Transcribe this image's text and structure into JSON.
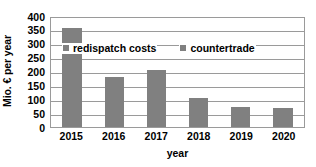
{
  "chart_data": {
    "type": "bar",
    "title": "",
    "subtitle": "",
    "categories": [
      "2015",
      "2016",
      "2017",
      "2018",
      "2019",
      "2020"
    ],
    "series": [
      {
        "name": "redispatch costs",
        "values": [
          355,
          180,
          205,
          101,
          70,
          68
        ]
      }
    ],
    "legend_entries": [
      "redispatch costs",
      "countertrade"
    ],
    "legend_position": "inside-top-center",
    "xlabel": "year",
    "ylabel": "Mio. € per year",
    "ylim": [
      0,
      400
    ],
    "ytick_values": [
      400,
      350,
      300,
      250,
      200,
      150,
      100,
      50,
      0
    ],
    "ytick_labels": [
      "400",
      "350",
      "300",
      "250",
      "200",
      "150",
      "100",
      "50",
      "0"
    ],
    "grid": true,
    "grid_axis": "y",
    "bar_color": "#808080",
    "grid_color": "#9a9a9a",
    "background_color": "#ffffff",
    "text_color": "#000000"
  }
}
